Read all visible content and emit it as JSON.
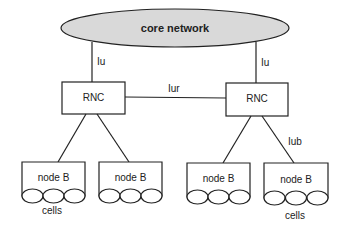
{
  "core": {
    "label": "core network",
    "fill": "#d9d9d9"
  },
  "links": {
    "iu_left": "Iu",
    "iu_right": "Iu",
    "iur": "Iur",
    "iub": "Iub"
  },
  "rnc": [
    {
      "label": "RNC"
    },
    {
      "label": "RNC"
    }
  ],
  "nodes": [
    {
      "label": "node B"
    },
    {
      "label": "node B"
    },
    {
      "label": "node B"
    },
    {
      "label": "node B"
    }
  ],
  "cells_labels": {
    "left": "cells",
    "right": "cells"
  }
}
